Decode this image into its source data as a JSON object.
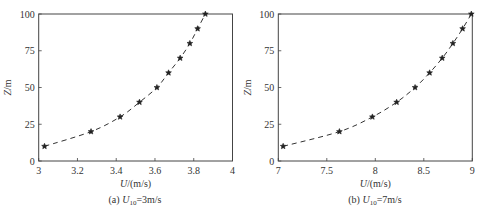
{
  "chart_data": [
    {
      "type": "line",
      "panel": "a",
      "caption_prefix": "(a)",
      "caption_var": "U",
      "caption_sub": "10",
      "caption_value": "=3m/s",
      "xlabel_var": "U",
      "xlabel_unit": "/(m/s)",
      "ylabel_var": "Z",
      "ylabel_unit": "/m",
      "xlim": [
        3,
        4
      ],
      "ylim": [
        0,
        100
      ],
      "xticks": [
        3,
        3.2,
        3.4,
        3.6,
        3.8,
        4
      ],
      "xtick_labels": [
        "3",
        "3.2",
        "3.4",
        "3.6",
        "3.8",
        "4"
      ],
      "yticks": [
        0,
        25,
        50,
        75,
        100
      ],
      "ytick_labels": [
        "0",
        "25",
        "50",
        "75",
        "100"
      ],
      "grid": false,
      "series": [
        {
          "name": "profile",
          "style": "dashed line with star markers",
          "x": [
            3.03,
            3.27,
            3.42,
            3.52,
            3.61,
            3.67,
            3.73,
            3.78,
            3.82,
            3.86
          ],
          "y": [
            10,
            20,
            30,
            40,
            50,
            60,
            70,
            80,
            90,
            100
          ]
        }
      ]
    },
    {
      "type": "line",
      "panel": "b",
      "caption_prefix": "(b)",
      "caption_var": "U",
      "caption_sub": "10",
      "caption_value": "=7m/s",
      "xlabel_var": "U",
      "xlabel_unit": "/(m/s)",
      "ylabel_var": "Z",
      "ylabel_unit": "/m",
      "xlim": [
        7,
        9
      ],
      "ylim": [
        0,
        100
      ],
      "xticks": [
        7,
        7.5,
        8,
        8.5,
        9
      ],
      "xtick_labels": [
        "7",
        "7.5",
        "8",
        "8.5",
        "9"
      ],
      "yticks": [
        0,
        25,
        50,
        75,
        100
      ],
      "ytick_labels": [
        "0",
        "25",
        "50",
        "75",
        "100"
      ],
      "grid": false,
      "series": [
        {
          "name": "profile",
          "style": "dashed line with star markers",
          "x": [
            7.05,
            7.63,
            7.97,
            8.22,
            8.41,
            8.56,
            8.69,
            8.8,
            8.9,
            8.99
          ],
          "y": [
            10,
            20,
            30,
            40,
            50,
            60,
            70,
            80,
            90,
            100
          ]
        }
      ]
    }
  ],
  "colors": {
    "line": "#333333",
    "marker": "#222222",
    "axis": "#444444"
  }
}
